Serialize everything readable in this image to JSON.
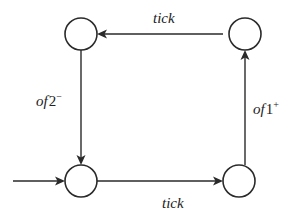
{
  "diagram": {
    "type": "state-machine",
    "states": [
      {
        "id": "top-left",
        "label": ""
      },
      {
        "id": "top-right",
        "label": ""
      },
      {
        "id": "bottom-left",
        "label": "",
        "initial": true
      },
      {
        "id": "bottom-right",
        "label": ""
      }
    ],
    "transitions": [
      {
        "from": "bottom-left",
        "to": "bottom-right",
        "label": "tick"
      },
      {
        "from": "bottom-right",
        "to": "top-right",
        "label_main": "of",
        "label_num": "1",
        "label_sup": "+"
      },
      {
        "from": "top-right",
        "to": "top-left",
        "label": "tick"
      },
      {
        "from": "top-left",
        "to": "bottom-left",
        "label_main": "of",
        "label_num": "2",
        "label_sup": "−"
      }
    ],
    "labels": {
      "top_tick": "tick",
      "bottom_tick": "tick",
      "left_of": "of",
      "left_num": "2",
      "left_sup": "−",
      "right_of": "of",
      "right_num": "1",
      "right_sup": "+"
    },
    "colors": {
      "stroke": "#2a2a2a",
      "text": "#222222",
      "background": "#ffffff"
    }
  }
}
